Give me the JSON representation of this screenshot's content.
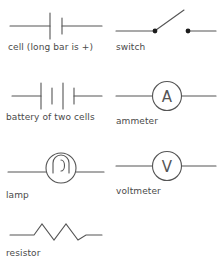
{
  "diagram": {
    "stroke_color": "#555555",
    "label_color": "#4a4a4a",
    "background_color": "#ffffff",
    "symbols": [
      {
        "id": "cell",
        "name": "cell",
        "label": "cell (long bar is +)",
        "column": "left",
        "row": 1,
        "icon": "cell-symbol",
        "bars": [
          "long",
          "short"
        ]
      },
      {
        "id": "switch",
        "name": "switch",
        "label": "switch",
        "column": "right",
        "row": 1,
        "icon": "switch-symbol",
        "state": "open"
      },
      {
        "id": "battery",
        "name": "battery of two cells",
        "label": "battery of two cells",
        "column": "left",
        "row": 2,
        "icon": "battery-symbol",
        "bars": [
          "long",
          "short",
          "long",
          "short"
        ]
      },
      {
        "id": "ammeter",
        "name": "ammeter",
        "label": "ammeter",
        "column": "right",
        "row": 2,
        "icon": "ammeter-symbol",
        "letter": "A"
      },
      {
        "id": "lamp",
        "name": "lamp",
        "label": "lamp",
        "column": "left",
        "row": 3,
        "icon": "lamp-symbol"
      },
      {
        "id": "voltmeter",
        "name": "voltmeter",
        "label": "voltmeter",
        "column": "right",
        "row": 3,
        "icon": "voltmeter-symbol",
        "letter": "V"
      },
      {
        "id": "resistor",
        "name": "resistor",
        "label": "resistor",
        "column": "left",
        "row": 4,
        "icon": "resistor-symbol",
        "peaks": 3
      }
    ]
  }
}
